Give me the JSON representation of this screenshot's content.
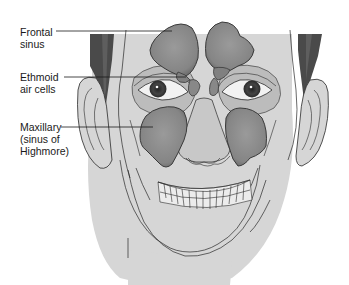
{
  "figure": {
    "labels": [
      {
        "id": "frontal",
        "text": "Frontal\nsinus"
      },
      {
        "id": "ethmoid",
        "text": "Ethmoid\nair cells"
      },
      {
        "id": "maxillary",
        "text": "Maxillary\n(sinus of\nHighmore)"
      }
    ]
  },
  "colors": {
    "skin": "#d6d6d6",
    "skin_light": "#e2e2e2",
    "hair": "#4a4a4a",
    "sinus": "#8c8c8c",
    "sinus_dark": "#6e6e6e",
    "orbit": "#bcbcbc",
    "outline": "#2a2a2a",
    "background": "#ffffff"
  }
}
